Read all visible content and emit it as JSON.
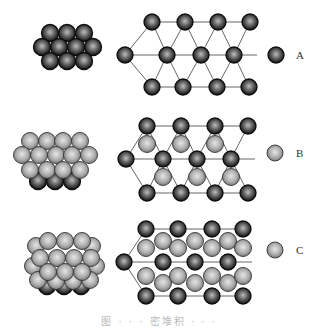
{
  "colors": {
    "dark_sphere": "#1a1a1a",
    "dark_highlight": "#bdbdbd",
    "light_sphere": "#7a7a7a",
    "light_highlight": "#e6e6e6",
    "line": "#555555",
    "background": "#ffffff"
  },
  "legend": [
    {
      "label": "A",
      "type": "dark",
      "cx": 276,
      "cy": 55,
      "lx": 296,
      "ly": 50
    },
    {
      "label": "B",
      "type": "light",
      "cx": 275,
      "cy": 153,
      "lx": 296,
      "ly": 148
    },
    {
      "label": "C",
      "type": "light",
      "cx": 275,
      "cy": 250,
      "lx": 296,
      "ly": 245
    }
  ],
  "caption": "图 · · · 密堆积 · · ·",
  "rows": [
    {
      "name": "layer-A",
      "cluster": [
        {
          "t": "dark",
          "x": 50,
          "y": 33
        },
        {
          "t": "dark",
          "x": 67,
          "y": 33
        },
        {
          "t": "dark",
          "x": 84,
          "y": 33
        },
        {
          "t": "dark",
          "x": 42,
          "y": 47
        },
        {
          "t": "dark",
          "x": 59,
          "y": 47
        },
        {
          "t": "dark",
          "x": 76,
          "y": 47
        },
        {
          "t": "dark",
          "x": 93,
          "y": 47
        },
        {
          "t": "dark",
          "x": 50,
          "y": 61
        },
        {
          "t": "dark",
          "x": 67,
          "y": 61
        },
        {
          "t": "dark",
          "x": 84,
          "y": 61
        }
      ],
      "lines": [
        [
          152,
          22,
          250,
          22
        ],
        [
          125,
          55,
          257,
          55
        ],
        [
          152,
          87,
          249,
          87
        ],
        [
          125,
          55,
          152,
          22
        ],
        [
          125,
          55,
          152,
          87
        ],
        [
          152,
          22,
          167,
          55
        ],
        [
          167,
          55,
          152,
          87
        ],
        [
          167,
          55,
          185,
          22
        ],
        [
          167,
          55,
          183,
          87
        ],
        [
          185,
          22,
          201,
          55
        ],
        [
          201,
          55,
          183,
          87
        ],
        [
          201,
          55,
          218,
          22
        ],
        [
          201,
          55,
          217,
          87
        ],
        [
          218,
          22,
          234,
          55
        ],
        [
          234,
          55,
          217,
          87
        ],
        [
          234,
          55,
          250,
          22
        ],
        [
          234,
          55,
          249,
          87
        ]
      ],
      "lattice": [
        {
          "t": "dark",
          "x": 152,
          "y": 22
        },
        {
          "t": "dark",
          "x": 185,
          "y": 22
        },
        {
          "t": "dark",
          "x": 218,
          "y": 22
        },
        {
          "t": "dark",
          "x": 250,
          "y": 22
        },
        {
          "t": "dark",
          "x": 125,
          "y": 55
        },
        {
          "t": "dark",
          "x": 167,
          "y": 55
        },
        {
          "t": "dark",
          "x": 201,
          "y": 55
        },
        {
          "t": "dark",
          "x": 234,
          "y": 55
        },
        {
          "t": "dark",
          "x": 152,
          "y": 87
        },
        {
          "t": "dark",
          "x": 183,
          "y": 87
        },
        {
          "t": "dark",
          "x": 217,
          "y": 87
        },
        {
          "t": "dark",
          "x": 249,
          "y": 87
        }
      ]
    },
    {
      "name": "layer-B",
      "cluster": [
        {
          "t": "dark",
          "x": 38,
          "y": 181
        },
        {
          "t": "dark",
          "x": 55,
          "y": 181
        },
        {
          "t": "dark",
          "x": 72,
          "y": 181
        },
        {
          "t": "light",
          "x": 30,
          "y": 141
        },
        {
          "t": "light",
          "x": 47,
          "y": 141
        },
        {
          "t": "light",
          "x": 63,
          "y": 141
        },
        {
          "t": "light",
          "x": 80,
          "y": 141
        },
        {
          "t": "light",
          "x": 22,
          "y": 155
        },
        {
          "t": "light",
          "x": 39,
          "y": 155
        },
        {
          "t": "light",
          "x": 56,
          "y": 155
        },
        {
          "t": "light",
          "x": 72,
          "y": 155
        },
        {
          "t": "light",
          "x": 89,
          "y": 155
        },
        {
          "t": "light",
          "x": 30,
          "y": 170
        },
        {
          "t": "light",
          "x": 47,
          "y": 170
        },
        {
          "t": "light",
          "x": 63,
          "y": 170
        },
        {
          "t": "light",
          "x": 80,
          "y": 170
        }
      ],
      "lines": [
        [
          147,
          126,
          248,
          126
        ],
        [
          126,
          159,
          255,
          159
        ],
        [
          147,
          193,
          248,
          193
        ],
        [
          126,
          159,
          147,
          126
        ],
        [
          126,
          159,
          147,
          193
        ],
        [
          147,
          126,
          163,
          159
        ],
        [
          163,
          159,
          147,
          193
        ],
        [
          163,
          159,
          181,
          126
        ],
        [
          163,
          159,
          181,
          193
        ],
        [
          181,
          126,
          197,
          159
        ],
        [
          197,
          159,
          181,
          193
        ],
        [
          197,
          159,
          215,
          126
        ],
        [
          197,
          159,
          215,
          193
        ],
        [
          215,
          126,
          231,
          159
        ],
        [
          231,
          159,
          215,
          193
        ],
        [
          231,
          159,
          248,
          126
        ],
        [
          231,
          159,
          248,
          193
        ]
      ],
      "lattice": [
        {
          "t": "dark",
          "x": 147,
          "y": 126
        },
        {
          "t": "dark",
          "x": 181,
          "y": 126
        },
        {
          "t": "dark",
          "x": 215,
          "y": 126
        },
        {
          "t": "dark",
          "x": 248,
          "y": 126
        },
        {
          "t": "light",
          "x": 147,
          "y": 144
        },
        {
          "t": "light",
          "x": 181,
          "y": 144
        },
        {
          "t": "light",
          "x": 215,
          "y": 144
        },
        {
          "t": "dark",
          "x": 126,
          "y": 159
        },
        {
          "t": "dark",
          "x": 163,
          "y": 159
        },
        {
          "t": "dark",
          "x": 197,
          "y": 159
        },
        {
          "t": "dark",
          "x": 231,
          "y": 159
        },
        {
          "t": "light",
          "x": 163,
          "y": 177
        },
        {
          "t": "light",
          "x": 197,
          "y": 177
        },
        {
          "t": "light",
          "x": 231,
          "y": 177
        },
        {
          "t": "dark",
          "x": 147,
          "y": 193
        },
        {
          "t": "dark",
          "x": 181,
          "y": 193
        },
        {
          "t": "dark",
          "x": 215,
          "y": 193
        },
        {
          "t": "dark",
          "x": 248,
          "y": 193
        }
      ]
    },
    {
      "name": "layer-C",
      "cluster": [
        {
          "t": "dark",
          "x": 47,
          "y": 286
        },
        {
          "t": "dark",
          "x": 64,
          "y": 286
        },
        {
          "t": "dark",
          "x": 81,
          "y": 286
        },
        {
          "t": "light",
          "x": 36,
          "y": 246
        },
        {
          "t": "light",
          "x": 92,
          "y": 246
        },
        {
          "t": "light",
          "x": 33,
          "y": 266
        },
        {
          "t": "light",
          "x": 96,
          "y": 266
        },
        {
          "t": "light",
          "x": 38,
          "y": 280
        },
        {
          "t": "light",
          "x": 56,
          "y": 281
        },
        {
          "t": "light",
          "x": 73,
          "y": 281
        },
        {
          "t": "light",
          "x": 90,
          "y": 280
        },
        {
          "t": "light",
          "x": 48,
          "y": 241
        },
        {
          "t": "light",
          "x": 65,
          "y": 241
        },
        {
          "t": "light",
          "x": 82,
          "y": 241
        },
        {
          "t": "light",
          "x": 40,
          "y": 258
        },
        {
          "t": "light",
          "x": 57,
          "y": 258
        },
        {
          "t": "light",
          "x": 74,
          "y": 258
        },
        {
          "t": "light",
          "x": 91,
          "y": 258
        },
        {
          "t": "light",
          "x": 48,
          "y": 272
        },
        {
          "t": "light",
          "x": 65,
          "y": 272
        },
        {
          "t": "light",
          "x": 82,
          "y": 272
        }
      ],
      "lines": [
        [
          146,
          229,
          243,
          229
        ],
        [
          124,
          262,
          252,
          262
        ],
        [
          146,
          296,
          243,
          296
        ],
        [
          124,
          262,
          146,
          229
        ],
        [
          124,
          262,
          146,
          296
        ]
      ],
      "lattice": [
        {
          "t": "dark",
          "x": 146,
          "y": 229
        },
        {
          "t": "dark",
          "x": 178,
          "y": 229
        },
        {
          "t": "dark",
          "x": 212,
          "y": 229
        },
        {
          "t": "dark",
          "x": 243,
          "y": 229
        },
        {
          "t": "dark",
          "x": 124,
          "y": 262
        },
        {
          "t": "dark",
          "x": 163,
          "y": 262
        },
        {
          "t": "dark",
          "x": 195,
          "y": 262
        },
        {
          "t": "dark",
          "x": 228,
          "y": 262
        },
        {
          "t": "dark",
          "x": 146,
          "y": 296
        },
        {
          "t": "dark",
          "x": 178,
          "y": 296
        },
        {
          "t": "dark",
          "x": 212,
          "y": 296
        },
        {
          "t": "dark",
          "x": 243,
          "y": 296
        },
        {
          "t": "light",
          "x": 146,
          "y": 248
        },
        {
          "t": "light",
          "x": 163,
          "y": 241
        },
        {
          "t": "light",
          "x": 178,
          "y": 248
        },
        {
          "t": "light",
          "x": 195,
          "y": 241
        },
        {
          "t": "light",
          "x": 212,
          "y": 248
        },
        {
          "t": "light",
          "x": 228,
          "y": 241
        },
        {
          "t": "light",
          "x": 243,
          "y": 248
        },
        {
          "t": "light",
          "x": 146,
          "y": 276
        },
        {
          "t": "light",
          "x": 163,
          "y": 283
        },
        {
          "t": "light",
          "x": 178,
          "y": 276
        },
        {
          "t": "light",
          "x": 195,
          "y": 283
        },
        {
          "t": "light",
          "x": 212,
          "y": 276
        },
        {
          "t": "light",
          "x": 228,
          "y": 283
        },
        {
          "t": "light",
          "x": 243,
          "y": 276
        }
      ]
    }
  ]
}
